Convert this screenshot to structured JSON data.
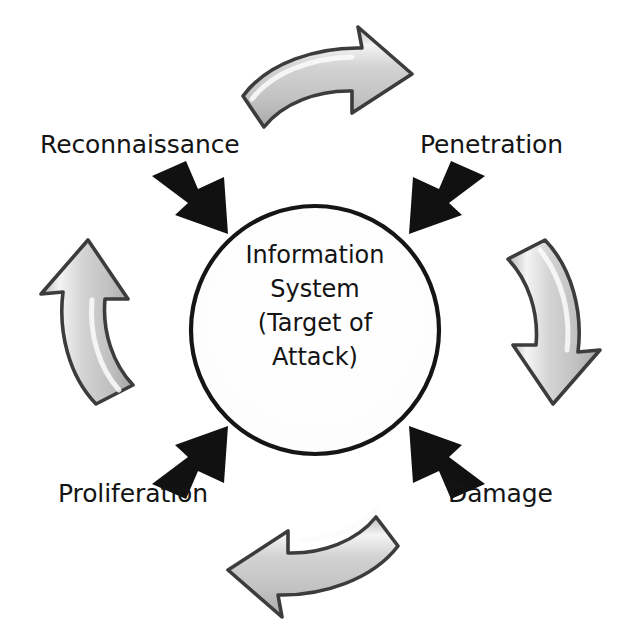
{
  "diagram": {
    "background_color": "#ffffff",
    "center_node": {
      "name": "information-system",
      "lines": [
        "Information",
        "System",
        "(Target of",
        "Attack)"
      ],
      "shape": "circle",
      "outline_color": "#111111",
      "fill_color": "#ffffff"
    },
    "stages": [
      {
        "id": "reconnaissance",
        "label": "Reconnaissance",
        "position": "top-left",
        "order": 1
      },
      {
        "id": "penetration",
        "label": "Penetration",
        "position": "top-right",
        "order": 2
      },
      {
        "id": "damage",
        "label": "Damage",
        "position": "bottom-right",
        "order": 3
      },
      {
        "id": "proliferation",
        "label": "Proliferation",
        "position": "bottom-left",
        "order": 4
      }
    ],
    "inward_arrows": [
      {
        "id": "arrow-reconnaissance-inward",
        "direction": "down-right",
        "color": "#111111"
      },
      {
        "id": "arrow-penetration-inward",
        "direction": "down-left",
        "color": "#111111"
      },
      {
        "id": "arrow-damage-inward",
        "direction": "up-left",
        "color": "#111111"
      },
      {
        "id": "arrow-proliferation-inward",
        "direction": "up-right",
        "color": "#111111"
      }
    ],
    "cycle_arrows": [
      {
        "id": "cycle-arrow-top",
        "direction": "right",
        "from": "reconnaissance",
        "to": "penetration"
      },
      {
        "id": "cycle-arrow-right",
        "direction": "down",
        "from": "penetration",
        "to": "damage"
      },
      {
        "id": "cycle-arrow-bottom",
        "direction": "left",
        "from": "damage",
        "to": "proliferation"
      },
      {
        "id": "cycle-arrow-left",
        "direction": "up",
        "from": "proliferation",
        "to": "reconnaissance"
      }
    ],
    "cycle_direction": "clockwise",
    "colors": {
      "arrow_gray_fill": "#c9c9c9",
      "arrow_gray_highlight": "#f2f2f2",
      "arrow_gray_shade": "#a8a8a8",
      "arrow_outline": "#3a3a3a",
      "black_arrow": "#111111",
      "text": "#141414"
    }
  }
}
